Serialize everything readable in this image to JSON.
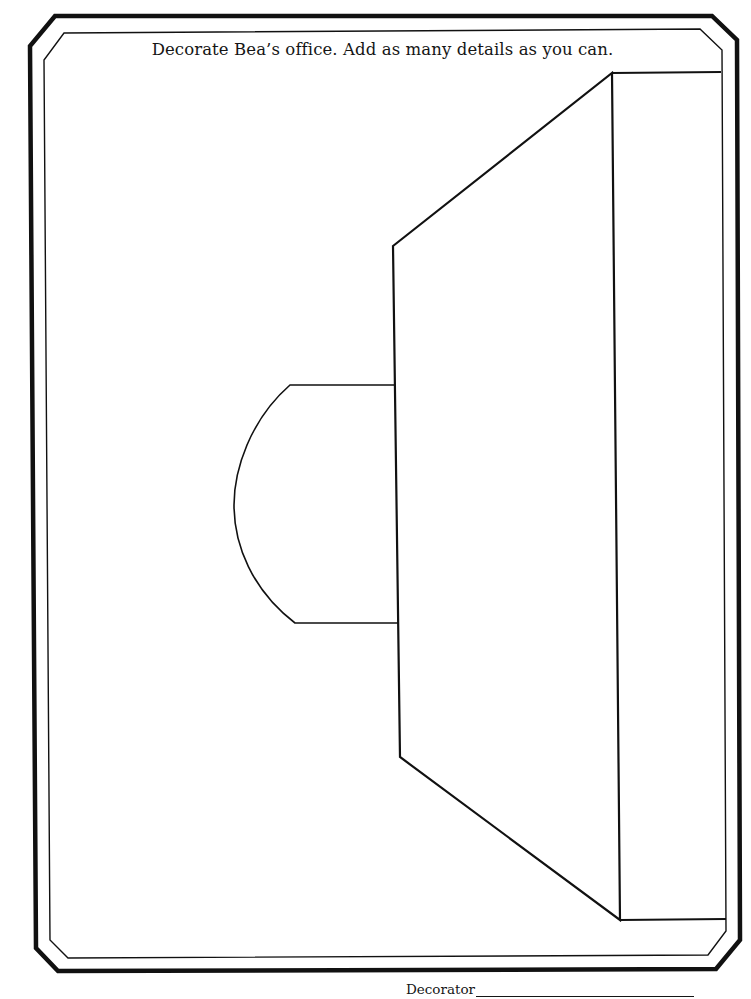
{
  "worksheet": {
    "instruction": "Decorate Bea’s office. Add as many details as you can.",
    "signature": {
      "label": "Decorator",
      "value": ""
    }
  },
  "drawing": {
    "stroke_color": "#111111",
    "elements": [
      "outer-octagonal-border",
      "inner-octagonal-border",
      "desk-return-half-round",
      "desk-top-perspective",
      "back-wall-panel"
    ]
  }
}
